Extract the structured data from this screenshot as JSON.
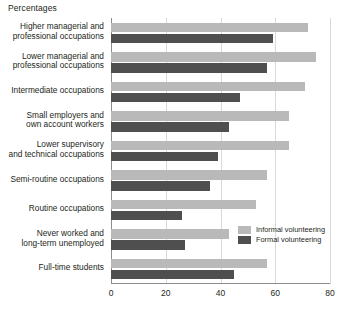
{
  "axis_title": "Percentages",
  "colors": {
    "informal": "#b9b9b9",
    "formal": "#4f4f4f",
    "grid": "#d9d9d9",
    "axis": "#8c8c8c",
    "text": "#231f20"
  },
  "legend": {
    "position": "inside-right",
    "items": [
      {
        "label": "Informal volunteering",
        "swatch": "informal"
      },
      {
        "label": "Formal volunteering",
        "swatch": "formal"
      }
    ]
  },
  "ticks": [
    {
      "label": "0",
      "value": 0
    },
    {
      "label": "20",
      "value": 20
    },
    {
      "label": "40",
      "value": 40
    },
    {
      "label": "60",
      "value": 60
    },
    {
      "label": "80",
      "value": 80
    }
  ],
  "chart_data": {
    "type": "bar",
    "orientation": "horizontal",
    "title": "",
    "subtitle": "",
    "xlabel": "Percentages",
    "ylabel": "",
    "xlim": [
      0,
      80
    ],
    "grid": true,
    "categories": [
      "Higher managerial and professional occupations",
      "Lower managerial and professional occupations",
      "Intermediate occupations",
      "Small employers and own account workers",
      "Lower supervisory and technical occupations",
      "Semi-routine occupations",
      "Routine occupations",
      "Never worked and long-term unemployed",
      "Full-time students"
    ],
    "category_lines": [
      [
        "Higher managerial and",
        "professional occupations"
      ],
      [
        "Lower managerial and",
        "professional occupations"
      ],
      [
        "Intermediate occupations"
      ],
      [
        "Small employers and",
        "own account workers"
      ],
      [
        "Lower supervisory",
        "and technical occupations"
      ],
      [
        "Semi-routine occupations"
      ],
      [
        "Routine occupations"
      ],
      [
        "Never worked and",
        "long-term unemployed"
      ],
      [
        "Full-time students"
      ]
    ],
    "series": [
      {
        "name": "Informal volunteering",
        "values": [
          72,
          75,
          71,
          65,
          65,
          57,
          53,
          43,
          57
        ]
      },
      {
        "name": "Formal volunteering",
        "values": [
          59,
          57,
          47,
          43,
          39,
          36,
          26,
          27,
          45
        ]
      }
    ]
  }
}
